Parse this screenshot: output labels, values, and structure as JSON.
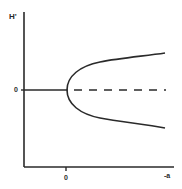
{
  "diagram": {
    "type": "bifurcation-diagram",
    "y_axis": {
      "label": "H'",
      "zero_label": "0"
    },
    "x_axis": {
      "label": "-a",
      "zero_label": "0"
    },
    "curves": [
      {
        "name": "stable-trivial-branch",
        "style": "solid",
        "description": "H'=0 for -a<0"
      },
      {
        "name": "unstable-trivial-branch",
        "style": "dashed",
        "description": "H'=0 for -a>0"
      },
      {
        "name": "upper-parabolic-branch",
        "style": "solid",
        "description": "positive branch emerging from -a=0"
      },
      {
        "name": "lower-parabolic-branch",
        "style": "solid",
        "description": "negative branch emerging from -a=0"
      }
    ],
    "colors": {
      "line": "#2a2a2a",
      "background": "#ffffff"
    }
  }
}
